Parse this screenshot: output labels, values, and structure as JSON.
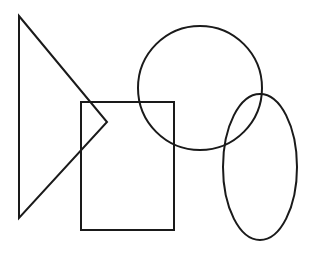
{
  "canvas": {
    "width": 315,
    "height": 255,
    "background": "#ffffff",
    "stroke_color": "#1a1a1a",
    "stroke_width": 2
  },
  "shapes": [
    {
      "id": "triangle",
      "type": "polygon",
      "points": [
        [
          19,
          16
        ],
        [
          107,
          122
        ],
        [
          19,
          218
        ]
      ]
    },
    {
      "id": "rectangle",
      "type": "rect",
      "x": 81,
      "y": 102,
      "width": 93,
      "height": 128
    },
    {
      "id": "circle",
      "type": "circle",
      "cx": 200,
      "cy": 88,
      "r": 62
    },
    {
      "id": "ellipse",
      "type": "ellipse",
      "cx": 260,
      "cy": 167,
      "rx": 37,
      "ry": 73
    }
  ]
}
